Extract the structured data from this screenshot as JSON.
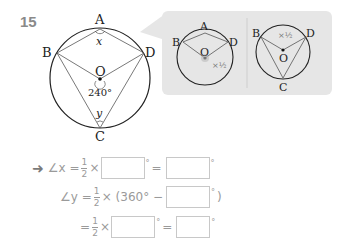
{
  "problem": {
    "number": "15",
    "main_figure": {
      "points": [
        "A",
        "B",
        "C",
        "D",
        "O"
      ],
      "angle_x_label": "x",
      "angle_y_label": "y",
      "center_angle_label": "240°"
    },
    "hint": {
      "left_labels": {
        "A": "A",
        "B": "B",
        "D": "D",
        "O": "O",
        "half": "×1/2"
      },
      "right_labels": {
        "B": "B",
        "D": "D",
        "O": "O",
        "C": "C",
        "half": "×1/2"
      }
    },
    "solution": {
      "arrow": "➜",
      "line1": {
        "lhs": "∠x =",
        "frac_num": "1",
        "frac_den": "2",
        "times": "×",
        "deg": "°",
        "eq": "=",
        "deg2": "°"
      },
      "line2": {
        "lhs": "∠y =",
        "frac_num": "1",
        "frac_den": "2",
        "times": "× (360° −",
        "deg": "°",
        "close": ")"
      },
      "line3": {
        "lhs": "=",
        "frac_num": "1",
        "frac_den": "2",
        "times": "×",
        "deg": "°",
        "eq": "=",
        "deg2": "°"
      }
    }
  },
  "colors": {
    "hint_bg": "#e6e6e6",
    "text_gray": "#9a9a9a",
    "line": "#222222"
  }
}
